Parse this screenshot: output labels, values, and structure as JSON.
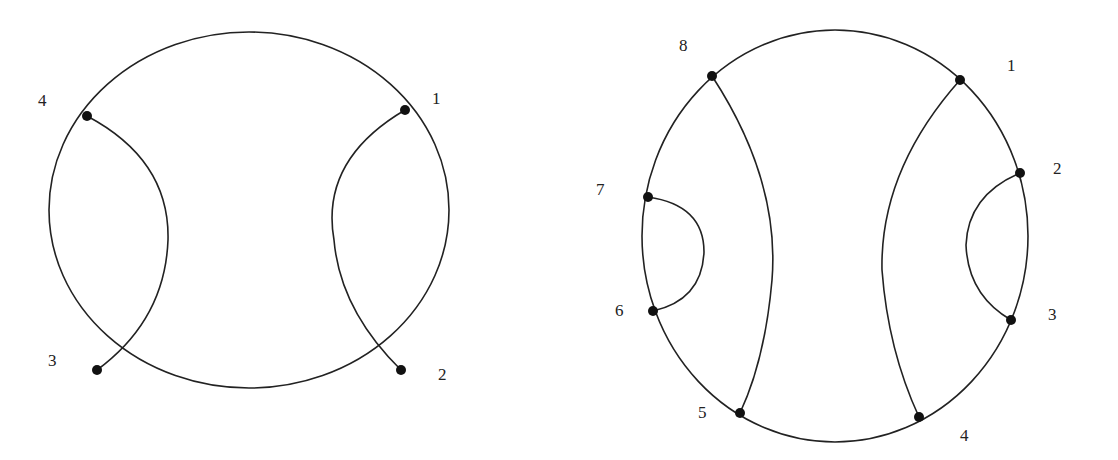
{
  "diagrams": [
    {
      "name": "chord-diagram-4",
      "points": [
        {
          "label": "1"
        },
        {
          "label": "2"
        },
        {
          "label": "3"
        },
        {
          "label": "4"
        }
      ],
      "chords": [
        [
          "1",
          "2"
        ],
        [
          "3",
          "4"
        ]
      ]
    },
    {
      "name": "chord-diagram-8",
      "points": [
        {
          "label": "1"
        },
        {
          "label": "2"
        },
        {
          "label": "3"
        },
        {
          "label": "4"
        },
        {
          "label": "5"
        },
        {
          "label": "6"
        },
        {
          "label": "7"
        },
        {
          "label": "8"
        }
      ],
      "chords": [
        [
          "1",
          "4"
        ],
        [
          "2",
          "3"
        ],
        [
          "5",
          "8"
        ],
        [
          "6",
          "7"
        ]
      ]
    }
  ]
}
